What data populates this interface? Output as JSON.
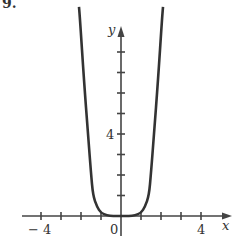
{
  "header": {
    "fragment": "9."
  },
  "chart_data": {
    "type": "line",
    "title": "",
    "xlabel": "x",
    "ylabel": "y",
    "xlim": [
      -5,
      5.4
    ],
    "ylim": [
      -0.5,
      9.3
    ],
    "x_ticks": [
      -4,
      -3,
      -2,
      -1,
      0,
      1,
      2,
      3,
      4
    ],
    "x_tick_labels": {
      "-4": "− 4",
      "0": "0",
      "4": "4"
    },
    "y_ticks": [
      1,
      2,
      3,
      4,
      5,
      6,
      7,
      8
    ],
    "y_tick_labels": {
      "4": "4"
    },
    "grid": false,
    "legend": null,
    "series": [
      {
        "name": "curve",
        "description": "even, U-shaped curve flat near origin (quartic-like)",
        "color": "#333333",
        "points": [
          [
            -2.1,
            10.2
          ],
          [
            -2.05,
            9.6
          ],
          [
            -1.85,
            6.6
          ],
          [
            -1.65,
            4.0
          ],
          [
            -1.5,
            2.1
          ],
          [
            -1.4,
            1.0
          ],
          [
            -1.2,
            0.45
          ],
          [
            -1.0,
            0.15
          ],
          [
            -0.7,
            0.03
          ],
          [
            -0.4,
            0.0
          ],
          [
            0,
            0
          ],
          [
            0.4,
            0.0
          ],
          [
            0.7,
            0.03
          ],
          [
            1.0,
            0.15
          ],
          [
            1.2,
            0.45
          ],
          [
            1.4,
            1.0
          ],
          [
            1.5,
            2.1
          ],
          [
            1.65,
            4.0
          ],
          [
            1.85,
            6.6
          ],
          [
            2.05,
            9.6
          ],
          [
            2.1,
            10.2
          ]
        ]
      }
    ]
  },
  "style": {
    "axis_color": "#444444",
    "curve_color": "#333333",
    "background": "#ffffff"
  }
}
